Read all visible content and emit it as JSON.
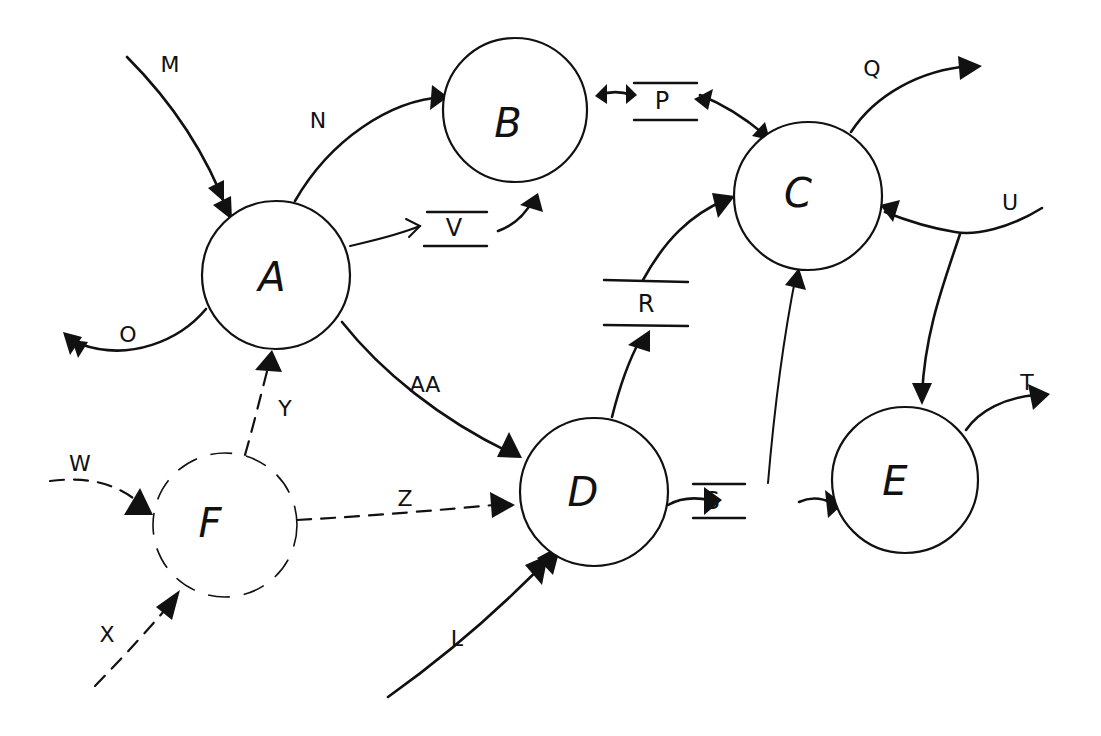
{
  "diagram": {
    "type": "data-flow-diagram",
    "style": "hand-drawn",
    "colors": {
      "ink": "#111111",
      "background": "#ffffff"
    },
    "processes": [
      {
        "id": "A",
        "label": "A",
        "cx": 276,
        "cy": 275,
        "r": 74,
        "dashed": false
      },
      {
        "id": "B",
        "label": "B",
        "cx": 515,
        "cy": 110,
        "r": 72,
        "dashed": false
      },
      {
        "id": "C",
        "label": "C",
        "cx": 808,
        "cy": 196,
        "r": 74,
        "dashed": false
      },
      {
        "id": "D",
        "label": "D",
        "cx": 594,
        "cy": 492,
        "r": 74,
        "dashed": false
      },
      {
        "id": "E",
        "label": "E",
        "cx": 905,
        "cy": 480,
        "r": 73,
        "dashed": false
      },
      {
        "id": "F",
        "label": "F",
        "cx": 225,
        "cy": 525,
        "r": 72,
        "dashed": true
      }
    ],
    "stores": [
      {
        "id": "P",
        "label": "P"
      },
      {
        "id": "R",
        "label": "R"
      },
      {
        "id": "S",
        "label": "S"
      },
      {
        "id": "V",
        "label": "V"
      }
    ],
    "flows": [
      {
        "id": "M",
        "label": "M",
        "from": "external",
        "to": "A",
        "style": "solid",
        "arrow": "double"
      },
      {
        "id": "N",
        "label": "N",
        "from": "A",
        "to": "B",
        "style": "solid"
      },
      {
        "id": "O",
        "label": "O",
        "from": "A",
        "to": "external",
        "style": "solid",
        "arrow": "double"
      },
      {
        "id": "V_in",
        "label": "",
        "from": "A",
        "to": "V",
        "style": "solid",
        "arrow": "open"
      },
      {
        "id": "V_out",
        "label": "",
        "from": "V",
        "to": "B",
        "style": "solid"
      },
      {
        "id": "P_B",
        "label": "",
        "from": "B",
        "to": "P",
        "style": "solid",
        "arrow": "bidirectional"
      },
      {
        "id": "P_C",
        "label": "",
        "from": "P",
        "to": "C",
        "style": "solid",
        "arrow": "bidirectional"
      },
      {
        "id": "Q",
        "label": "Q",
        "from": "C",
        "to": "external",
        "style": "solid"
      },
      {
        "id": "U",
        "label": "U",
        "from": "external",
        "to": "C",
        "style": "solid",
        "branches_to": "E"
      },
      {
        "id": "R_in",
        "label": "",
        "from": "D",
        "to": "R",
        "style": "solid"
      },
      {
        "id": "R_out",
        "label": "",
        "from": "R",
        "to": "C",
        "style": "solid"
      },
      {
        "id": "S_in",
        "label": "",
        "from": "D",
        "to": "S",
        "style": "solid"
      },
      {
        "id": "S_out",
        "label": "",
        "from": "S",
        "to": "E",
        "style": "solid"
      },
      {
        "id": "S_C",
        "label": "",
        "from": "S",
        "to": "C",
        "style": "solid"
      },
      {
        "id": "T",
        "label": "T",
        "from": "E",
        "to": "external",
        "style": "solid"
      },
      {
        "id": "AA",
        "label": "AA",
        "from": "A",
        "to": "D",
        "style": "solid"
      },
      {
        "id": "L",
        "label": "L",
        "from": "external",
        "to": "D",
        "style": "solid",
        "arrow": "double"
      },
      {
        "id": "W",
        "label": "W",
        "from": "external",
        "to": "F",
        "style": "dashed"
      },
      {
        "id": "X",
        "label": "X",
        "from": "external",
        "to": "F",
        "style": "dashed"
      },
      {
        "id": "Y",
        "label": "Y",
        "from": "F",
        "to": "A",
        "style": "dashed"
      },
      {
        "id": "Z",
        "label": "Z",
        "from": "F",
        "to": "D",
        "style": "dashed"
      }
    ]
  },
  "labels": {
    "A": "A",
    "B": "B",
    "C": "C",
    "D": "D",
    "E": "E",
    "F": "F",
    "P": "P",
    "R": "R",
    "S": "S",
    "V": "V",
    "M": "M",
    "N": "N",
    "O": "O",
    "Q": "Q",
    "T": "T",
    "U": "U",
    "L": "L",
    "W": "W",
    "X": "X",
    "Y": "Y",
    "Z": "Z",
    "AA": "AA"
  }
}
